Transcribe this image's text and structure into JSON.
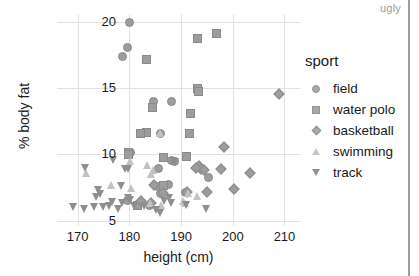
{
  "watermark": "ugly",
  "chart_data": {
    "type": "scatter",
    "title": "",
    "xlabel": "height (cm)",
    "ylabel": "% body fat",
    "xlim": [
      166,
      213
    ],
    "ylim": [
      4.6,
      20.6
    ],
    "xticks": [
      170,
      180,
      190,
      200,
      210
    ],
    "yticks": [
      5,
      10,
      15,
      20
    ],
    "grid": true,
    "legend_title": "sport",
    "legend_position": "right",
    "series": [
      {
        "name": "field",
        "marker": "circle",
        "color": "#9d9d9d",
        "points": [
          [
            180.0,
            20.0
          ],
          [
            179.6,
            18.1
          ],
          [
            178.5,
            17.4
          ],
          [
            184.6,
            14.0
          ],
          [
            188.0,
            14.0
          ],
          [
            186.0,
            11.6
          ],
          [
            180.2,
            10.2
          ],
          [
            188.0,
            9.6
          ],
          [
            188.6,
            9.5
          ],
          [
            185.5,
            9.0
          ],
          [
            195.3,
            8.3
          ],
          [
            187.5,
            7.8
          ],
          [
            185.3,
            7.6
          ],
          [
            186.0,
            7.1
          ],
          [
            190.8,
            7.2
          ],
          [
            183.8,
            6.2
          ],
          [
            179.5,
            6.6
          ]
        ]
      },
      {
        "name": "water polo",
        "marker": "square",
        "color": "#9d9d9d",
        "points": [
          [
            196.8,
            19.2
          ],
          [
            193.0,
            18.8
          ],
          [
            183.2,
            17.2
          ],
          [
            193.0,
            15.0
          ],
          [
            193.3,
            14.8
          ],
          [
            191.8,
            13.1
          ],
          [
            184.4,
            13.6
          ],
          [
            191.5,
            11.6
          ],
          [
            183.2,
            11.7
          ],
          [
            182.0,
            11.6
          ],
          [
            191.0,
            9.9
          ],
          [
            186.5,
            9.8
          ],
          [
            179.8,
            10.2
          ],
          [
            179.7,
            10.0
          ],
          [
            186.5,
            7.7
          ],
          [
            181.5,
            6.2
          ]
        ]
      },
      {
        "name": "basketball",
        "marker": "diamond",
        "color": "#9d9d9d",
        "points": [
          [
            209.0,
            14.6
          ],
          [
            198.3,
            10.6
          ],
          [
            197.8,
            8.9
          ],
          [
            203.3,
            8.6
          ],
          [
            193.4,
            9.1
          ],
          [
            193.8,
            8.9
          ],
          [
            194.4,
            8.8
          ],
          [
            192.8,
            9.0
          ],
          [
            200.3,
            7.4
          ],
          [
            195.0,
            7.2
          ],
          [
            191.2,
            7.2
          ],
          [
            184.8,
            7.7
          ],
          [
            186.5,
            7.1
          ],
          [
            182.2,
            6.5
          ],
          [
            184.2,
            6.3
          ]
        ]
      },
      {
        "name": "swimming",
        "marker": "triangle-up",
        "color": "#c2c2c2",
        "points": [
          [
            186.0,
            11.6
          ],
          [
            180.3,
            9.5
          ],
          [
            183.5,
            9.2
          ],
          [
            184.6,
            8.8
          ],
          [
            184.2,
            8.5
          ],
          [
            171.8,
            8.6
          ],
          [
            176.5,
            7.7
          ],
          [
            180.5,
            7.5
          ],
          [
            191.5,
            7.1
          ],
          [
            193.2,
            6.9
          ],
          [
            190.5,
            6.5
          ],
          [
            190.8,
            6.3
          ],
          [
            184.0,
            6.3
          ],
          [
            186.2,
            6.2
          ]
        ]
      },
      {
        "name": "track",
        "marker": "triangle-down",
        "color": "#8e8e8e",
        "points": [
          [
            177.0,
            9.6
          ],
          [
            171.5,
            9.0
          ],
          [
            179.2,
            8.9
          ],
          [
            179.8,
            8.9
          ],
          [
            188.5,
            9.5
          ],
          [
            189.0,
            9.4
          ],
          [
            178.4,
            7.6
          ],
          [
            174.0,
            7.3
          ],
          [
            174.5,
            7.0
          ],
          [
            173.6,
            6.8
          ],
          [
            179.8,
            6.7
          ],
          [
            180.2,
            6.6
          ],
          [
            176.8,
            6.4
          ],
          [
            178.6,
            6.3
          ],
          [
            187.8,
            6.7
          ],
          [
            186.8,
            6.5
          ],
          [
            188.2,
            6.3
          ],
          [
            191.0,
            6.2
          ],
          [
            169.2,
            6.0
          ],
          [
            171.3,
            5.9
          ],
          [
            173.2,
            6.0
          ],
          [
            175.0,
            6.0
          ],
          [
            176.2,
            6.1
          ],
          [
            177.8,
            5.9
          ],
          [
            181.0,
            6.1
          ],
          [
            183.0,
            6.1
          ],
          [
            185.3,
            5.8
          ],
          [
            186.0,
            5.6
          ],
          [
            195.0,
            5.9
          ]
        ]
      }
    ]
  }
}
